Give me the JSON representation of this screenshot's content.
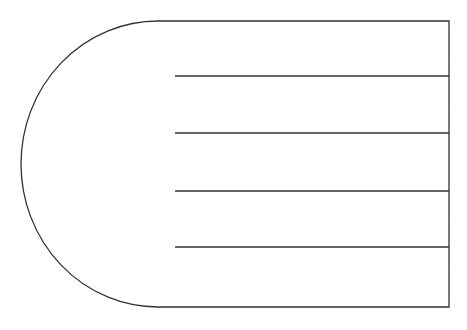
{
  "diagram": {
    "stroke_color": "#333333",
    "background": "#ffffff",
    "shape": {
      "top_y": 21,
      "bottom_y": 307,
      "right_x": 449,
      "arc_start_x": 158,
      "arc_leftmost_x": 21
    },
    "lines": [
      {
        "x1": 175,
        "x2": 449,
        "y": 76
      },
      {
        "x1": 175,
        "x2": 449,
        "y": 133
      },
      {
        "x1": 175,
        "x2": 449,
        "y": 191
      },
      {
        "x1": 175,
        "x2": 449,
        "y": 247
      }
    ]
  }
}
